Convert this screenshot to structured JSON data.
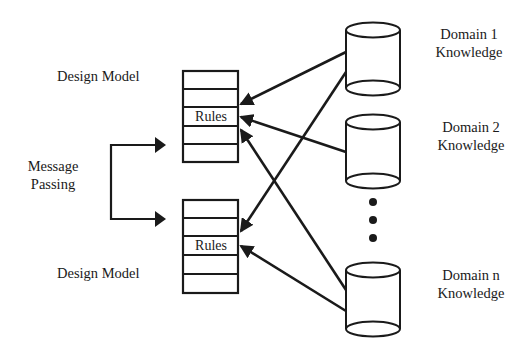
{
  "diagram": {
    "colors": {
      "stroke": "#1a1a1a",
      "background": "#ffffff"
    },
    "design_models": [
      {
        "label": "Design Model",
        "rules_label": "Rules",
        "rows": 5,
        "rules_row_index": 2
      },
      {
        "label": "Design Model",
        "rules_label": "Rules",
        "rows": 5,
        "rules_row_index": 2
      }
    ],
    "message_passing": {
      "line1": "Message",
      "line2": "Passing"
    },
    "knowledge_sources": [
      {
        "line1": "Domain 1",
        "line2": "Knowledge",
        "icon": "database-cylinder-icon"
      },
      {
        "line1": "Domain 2",
        "line2": "Knowledge",
        "icon": "database-cylinder-icon"
      },
      {
        "line1": "Domain n",
        "line2": "Knowledge",
        "icon": "database-cylinder-icon"
      }
    ],
    "ellipsis": "•••",
    "connections": [
      {
        "from": "Domain 1 Knowledge",
        "to": "Design Model 1"
      },
      {
        "from": "Domain 1 Knowledge",
        "to": "Design Model 2"
      },
      {
        "from": "Domain 2 Knowledge",
        "to": "Design Model 1"
      },
      {
        "from": "Domain n Knowledge",
        "to": "Design Model 1"
      },
      {
        "from": "Domain n Knowledge",
        "to": "Design Model 2"
      },
      {
        "from": "Message Passing",
        "to": "Design Model 1"
      },
      {
        "from": "Message Passing",
        "to": "Design Model 2"
      }
    ]
  }
}
